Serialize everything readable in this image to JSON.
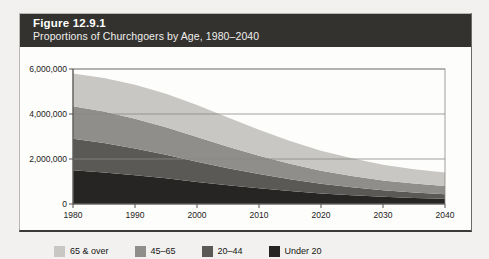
{
  "figure": {
    "title": "Figure 12.9.1",
    "subtitle": "Proportions of Churchgoers by Age, 1980–2040"
  },
  "colors": {
    "header_band": "#33322f",
    "frame_border": "#b9b7b4",
    "page_background": "#f2f1ef",
    "plot_background": "#fdfdfc",
    "gridline": "#8a8885",
    "axis": "#55534f",
    "series_65_over": "#c8c7c4",
    "series_45_65": "#8f8e8b",
    "series_20_44": "#5a5956",
    "series_under_20": "#262523"
  },
  "axes": {
    "y_ticks": [
      "0",
      "2,000,000",
      "4,000,000",
      "6,000,000"
    ],
    "x_ticks": [
      "1980",
      "1990",
      "2000",
      "2010",
      "2020",
      "2030",
      "2040"
    ]
  },
  "legend": {
    "items": [
      {
        "label": "65 & over",
        "color": "#c8c7c4"
      },
      {
        "label": "45–65",
        "color": "#8f8e8b"
      },
      {
        "label": "20–44",
        "color": "#5a5956"
      },
      {
        "label": "Under 20",
        "color": "#262523"
      }
    ]
  },
  "chart_data": {
    "type": "area",
    "stacked": true,
    "title": "Proportions of Churchgoers by Age, 1980–2040",
    "xlabel": "",
    "ylabel": "",
    "x": [
      1980,
      1985,
      1990,
      1995,
      2000,
      2005,
      2010,
      2015,
      2020,
      2025,
      2030,
      2035,
      2040
    ],
    "xlim": [
      1980,
      2040
    ],
    "ylim": [
      0,
      6000000
    ],
    "y_tick_values": [
      0,
      2000000,
      4000000,
      6000000
    ],
    "grid": true,
    "legend_position": "bottom",
    "series": [
      {
        "name": "Under 20",
        "color": "#262523",
        "values": [
          1500000,
          1400000,
          1280000,
          1140000,
          980000,
          830000,
          700000,
          580000,
          470000,
          390000,
          320000,
          270000,
          230000
        ]
      },
      {
        "name": "20–44",
        "color": "#5a5956",
        "values": [
          1400000,
          1310000,
          1190000,
          1050000,
          900000,
          760000,
          630000,
          520000,
          430000,
          350000,
          290000,
          240000,
          200000
        ]
      },
      {
        "name": "45–65",
        "color": "#8f8e8b",
        "values": [
          1450000,
          1400000,
          1320000,
          1220000,
          1100000,
          960000,
          820000,
          690000,
          580000,
          500000,
          440000,
          400000,
          370000
        ]
      },
      {
        "name": "65 & over",
        "color": "#c8c7c4",
        "values": [
          1450000,
          1490000,
          1510000,
          1490000,
          1420000,
          1300000,
          1150000,
          1010000,
          890000,
          790000,
          700000,
          640000,
          600000
        ]
      }
    ],
    "totals": [
      5800000,
      5600000,
      5300000,
      4900000,
      4400000,
      3850000,
      3300000,
      2800000,
      2370000,
      2030000,
      1750000,
      1550000,
      1400000
    ]
  }
}
